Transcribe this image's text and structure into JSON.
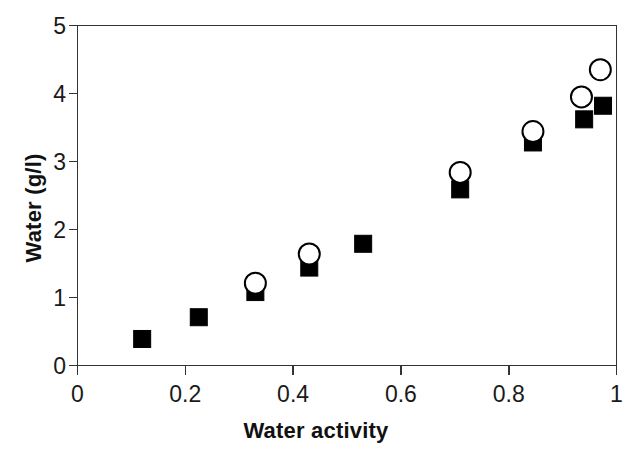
{
  "chart_data": {
    "type": "scatter",
    "title": "",
    "xlabel": "Water activity",
    "ylabel": "Water (g/l)",
    "xlim": [
      0,
      1
    ],
    "ylim": [
      0,
      5
    ],
    "xticks": [
      "0",
      "0.2",
      "0.4",
      "0.6",
      "0.8",
      "1"
    ],
    "xtick_values": [
      0,
      0.2,
      0.4,
      0.6,
      0.8,
      1
    ],
    "yticks": [
      "0",
      "1",
      "2",
      "3",
      "4",
      "5"
    ],
    "ytick_values": [
      0,
      1,
      2,
      3,
      4,
      5
    ],
    "grid": false,
    "legend": "none",
    "series": [
      {
        "name": "filled-square",
        "marker": "square",
        "fill": "#000000",
        "stroke": "#000000",
        "points": [
          {
            "x": 0.12,
            "y": 0.39
          },
          {
            "x": 0.225,
            "y": 0.71
          },
          {
            "x": 0.33,
            "y": 1.08
          },
          {
            "x": 0.43,
            "y": 1.44
          },
          {
            "x": 0.53,
            "y": 1.79
          },
          {
            "x": 0.71,
            "y": 2.59
          },
          {
            "x": 0.845,
            "y": 3.28
          },
          {
            "x": 0.94,
            "y": 3.62
          },
          {
            "x": 0.975,
            "y": 3.82
          }
        ]
      },
      {
        "name": "open-circle",
        "marker": "circle",
        "fill": "#ffffff",
        "stroke": "#000000",
        "points": [
          {
            "x": 0.33,
            "y": 1.21
          },
          {
            "x": 0.43,
            "y": 1.64
          },
          {
            "x": 0.71,
            "y": 2.84
          },
          {
            "x": 0.845,
            "y": 3.44
          },
          {
            "x": 0.935,
            "y": 3.95
          },
          {
            "x": 0.97,
            "y": 4.35
          }
        ]
      }
    ]
  },
  "axes": {
    "x_title": "Water activity",
    "y_title": "Water (g/l)"
  },
  "colors": {
    "axis": "#333333",
    "marker": "#000000",
    "background": "#ffffff"
  }
}
